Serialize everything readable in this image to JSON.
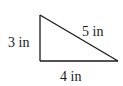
{
  "diagram": {
    "type": "right-triangle",
    "vertices": {
      "top": [
        40,
        15
      ],
      "right_angle": [
        40,
        61
      ],
      "right": [
        118,
        61
      ]
    },
    "stroke_color": "#1a1a1a",
    "background": "#ffffff",
    "labels": {
      "vertical_side": "3 in",
      "hypotenuse": "5 in",
      "horizontal_side": "4 in"
    }
  }
}
